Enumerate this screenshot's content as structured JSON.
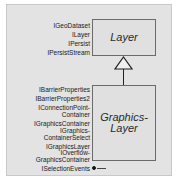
{
  "diagram": {
    "type": "uml-class-diagram",
    "colors": {
      "panel_background": "#e3e3e3",
      "class_fill": "#e0e0e0",
      "class_border": "#6b6b6b",
      "line": "#1f1f1f",
      "text": "#202020"
    }
  },
  "classes": [
    {
      "id": "layer",
      "name": "Layer",
      "abstract": true,
      "interfaces": [
        {
          "name": "IGeoDataset",
          "notation": "hollow"
        },
        {
          "name": "ILayer",
          "notation": "hollow"
        },
        {
          "name": "IPersist",
          "notation": "hollow"
        },
        {
          "name": "IPersistStream",
          "notation": "hollow"
        }
      ]
    },
    {
      "id": "graphics-layer",
      "name": "Graphics-\nLayer",
      "abstract": true,
      "interfaces": [
        {
          "name": "IBarrierProperties",
          "notation": "hollow"
        },
        {
          "name": "IBarrierProperties2",
          "notation": "hollow"
        },
        {
          "name": "IConnectionPoint-\nContainer",
          "notation": "hollow"
        },
        {
          "name": "IGraphicsContainer",
          "notation": "hollow"
        },
        {
          "name": "IGraphics-\nContainerSelect",
          "notation": "hollow"
        },
        {
          "name": "IGraphicsLayer",
          "notation": "hollow"
        },
        {
          "name": "IOverflow-\nGraphicsContainer",
          "notation": "hollow"
        },
        {
          "name": "ISelectionEvents",
          "notation": "filled"
        }
      ]
    }
  ],
  "relationships": [
    {
      "kind": "generalization",
      "from": "graphics-layer",
      "to": "layer",
      "arrow": "hollow-triangle"
    }
  ]
}
